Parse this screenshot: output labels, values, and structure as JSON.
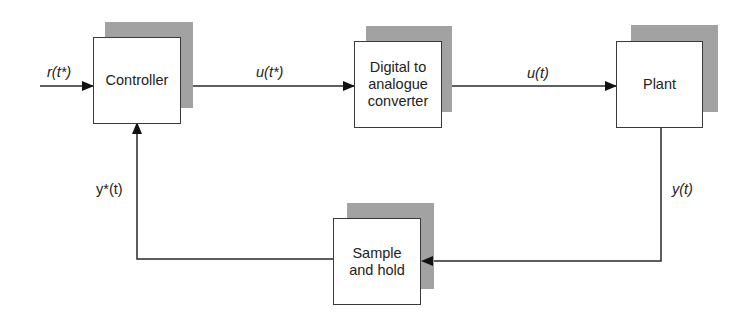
{
  "diagram": {
    "type": "block-diagram",
    "blocks": [
      {
        "id": "controller",
        "label": "Controller"
      },
      {
        "id": "dac",
        "label": "Digital to analogue converter",
        "lines": [
          "Digital to",
          "analogue",
          "converter"
        ]
      },
      {
        "id": "plant",
        "label": "Plant"
      },
      {
        "id": "sample_hold",
        "label": "Sample and hold",
        "lines": [
          "Sample",
          "and hold"
        ]
      }
    ],
    "signals": {
      "reference": "r(t*)",
      "controller_output": "u(t*)",
      "plant_input": "u(t)",
      "plant_output": "y(t)",
      "sampled_feedback": "y*(t)"
    },
    "edges": [
      {
        "from": "input",
        "to": "controller",
        "label": "r(t*)"
      },
      {
        "from": "controller",
        "to": "dac",
        "label": "u(t*)"
      },
      {
        "from": "dac",
        "to": "plant",
        "label": "u(t)"
      },
      {
        "from": "plant",
        "to": "sample_hold",
        "label": "y(t)"
      },
      {
        "from": "sample_hold",
        "to": "controller",
        "label": "y*(t)"
      }
    ]
  }
}
